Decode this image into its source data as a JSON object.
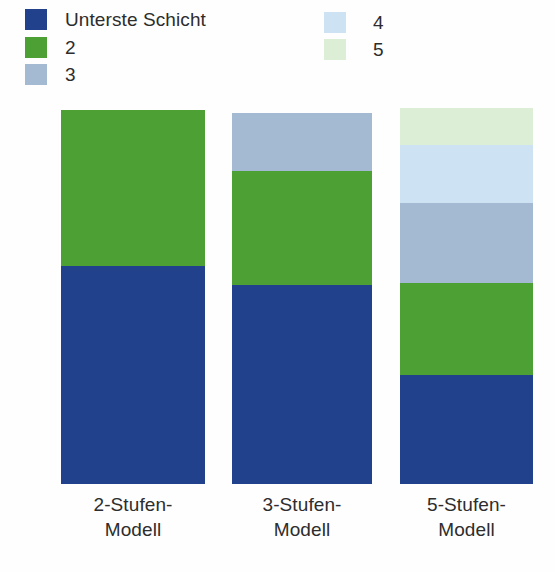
{
  "chart_data": {
    "type": "bar",
    "title": "",
    "subtitle": "",
    "xlabel": "",
    "ylabel": "",
    "stacked": true,
    "orientation": "vertical",
    "grid": false,
    "legend_position": "top",
    "ylim": [
      0,
      100
    ],
    "categories": [
      "2-Stufen-Modell",
      "3-Stufen-Modell",
      "5-Stufen-Modell"
    ],
    "series": [
      {
        "name": "Unterste Schicht",
        "color": "#21418d",
        "values": [
          58.4,
          53.6,
          29.0
        ]
      },
      {
        "name": "2",
        "color": "#4da033",
        "values": [
          41.6,
          30.7,
          28.0
        ]
      },
      {
        "name": "3",
        "color": "#a4bad3",
        "values": [
          0,
          15.7,
          24.4
        ]
      },
      {
        "name": "4",
        "color": "#cde3f4",
        "values": [
          0,
          0,
          17.7
        ]
      },
      {
        "name": "5",
        "color": "#dcefd6",
        "values": [
          0,
          0,
          11.0
        ]
      }
    ],
    "annotations": []
  },
  "legend": {
    "items": [
      {
        "label": "Unterste Schicht",
        "color": "#21418d",
        "column": "left",
        "index": 0
      },
      {
        "label": "2",
        "color": "#4da033",
        "column": "left",
        "index": 1
      },
      {
        "label": "3",
        "color": "#a4bad3",
        "column": "left",
        "index": 2
      },
      {
        "label": "4",
        "color": "#cde3f4",
        "column": "right",
        "index": 0
      },
      {
        "label": "5",
        "color": "#dcefd6",
        "column": "right",
        "index": 1
      }
    ]
  },
  "bars": [
    {
      "id": "bar-2-stufen",
      "label_line1": "2-Stufen-",
      "label_line2": "Modell",
      "segments": [
        {
          "series": "2",
          "color": "#4da033",
          "percent": 41.6
        },
        {
          "series": "Unterste Schicht",
          "color": "#21418d",
          "percent": 58.4
        }
      ]
    },
    {
      "id": "bar-3-stufen",
      "label_line1": "3-Stufen-",
      "label_line2": "Modell",
      "segments": [
        {
          "series": "3",
          "color": "#a4bad3",
          "percent": 15.7
        },
        {
          "series": "2",
          "color": "#4da033",
          "percent": 30.7
        },
        {
          "series": "Unterste Schicht",
          "color": "#21418d",
          "percent": 53.6
        }
      ]
    },
    {
      "id": "bar-5-stufen",
      "label_line1": "5-Stufen-",
      "label_line2": "Modell",
      "segments": [
        {
          "series": "5",
          "color": "#dcefd6",
          "percent": 9.9
        },
        {
          "series": "4",
          "color": "#cde3f4",
          "percent": 15.4
        },
        {
          "series": "3",
          "color": "#a4bad3",
          "percent": 21.3
        },
        {
          "series": "2",
          "color": "#4da033",
          "percent": 24.5
        },
        {
          "series": "Unterste Schicht",
          "color": "#21418d",
          "percent": 29.0
        }
      ]
    }
  ],
  "colors": {
    "background": "#fefefe",
    "text": "#2d2d2d",
    "layer1_dark_blue": "#21418d",
    "layer2_green": "#4da033",
    "layer3_slate_blue": "#a4bad3",
    "layer4_light_blue": "#cde3f4",
    "layer5_light_green": "#dcefd6"
  }
}
